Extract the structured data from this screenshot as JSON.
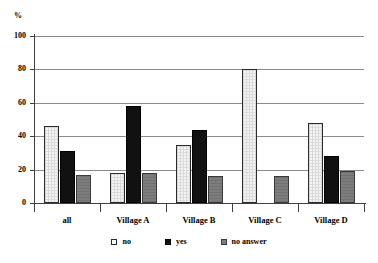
{
  "chart_data": {
    "type": "bar",
    "title": "",
    "subtitle": "",
    "xlabel": "",
    "ylabel": "%",
    "ylim": [
      0,
      100
    ],
    "ytick_step": 20,
    "yticks": [
      100,
      80,
      60,
      40,
      20,
      0
    ],
    "ytick_labels": [
      "100",
      "80",
      "60",
      "40",
      "20",
      "0"
    ],
    "grid": true,
    "legend_position": "bottom",
    "categories": [
      "all",
      "Village A",
      "Village B",
      "Village C",
      "Village D"
    ],
    "series": [
      {
        "name": "no",
        "color": "#f4f4f4",
        "values": [
          46,
          18,
          35,
          80,
          48
        ]
      },
      {
        "name": "yes",
        "color": "#111111",
        "values": [
          31,
          58,
          44,
          0,
          28
        ]
      },
      {
        "name": "no answer",
        "color": "#7d7d7d",
        "values": [
          17,
          18,
          16,
          16,
          19
        ]
      }
    ]
  },
  "legend": {
    "items": [
      {
        "label": "no",
        "swatch": "hollow-square-icon"
      },
      {
        "label": "yes",
        "swatch": "filled-black-square-icon"
      },
      {
        "label": "no answer",
        "swatch": "filled-gray-square-icon"
      }
    ]
  }
}
